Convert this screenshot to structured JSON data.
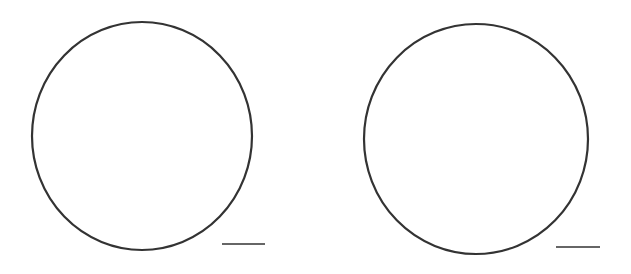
{
  "figure": {
    "background": "#ffffff",
    "stroke_color": "#333333",
    "shapes": [
      {
        "type": "circle",
        "cx": 142,
        "cy": 136,
        "rx": 110,
        "ry": 114,
        "stroke_width": 2.2,
        "answer_line": {
          "x1": 222,
          "x2": 265,
          "y": 244
        }
      },
      {
        "type": "circle",
        "cx": 476,
        "cy": 139,
        "rx": 112,
        "ry": 115,
        "stroke_width": 2.2,
        "answer_line": {
          "x1": 556,
          "x2": 600,
          "y": 247
        }
      }
    ]
  }
}
